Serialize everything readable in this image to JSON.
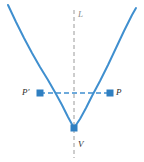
{
  "figure": {
    "background_color": "#ffffff",
    "width": 144,
    "height": 162
  },
  "colors": {
    "curve": "#3f8fcf",
    "chord": "#3f8fcf",
    "point_marker": "#2f7fc1",
    "axis_dashed": "#9a9a9a",
    "label_text": "#2b2b2b",
    "label_text_dim": "#8a8a8a"
  },
  "labels": {
    "axis_line": "L",
    "point_left": "P′",
    "point_right": "P",
    "vertex": "V"
  },
  "chart_data": {
    "type": "line",
    "xlabel": "",
    "ylabel": "",
    "grid": false,
    "legend": false,
    "xlim": [
      0,
      144
    ],
    "ylim": [
      162,
      0
    ],
    "series": [
      {
        "name": "parabola",
        "style": "solid",
        "color": "#3f8fcf",
        "points": [
          [
            8,
            5
          ],
          [
            16,
            22
          ],
          [
            24,
            38
          ],
          [
            32,
            53
          ],
          [
            40,
            67
          ],
          [
            48,
            80
          ],
          [
            56,
            94
          ],
          [
            62,
            105
          ],
          [
            68,
            117
          ],
          [
            74,
            128
          ],
          [
            80,
            119
          ],
          [
            86,
            108
          ],
          [
            92,
            96
          ],
          [
            100,
            81
          ],
          [
            108,
            65
          ],
          [
            116,
            48
          ],
          [
            124,
            31
          ],
          [
            132,
            15
          ],
          [
            136,
            8
          ]
        ]
      },
      {
        "name": "axis-of-symmetry",
        "style": "dashed",
        "color": "#9a9a9a",
        "points": [
          [
            74,
            10
          ],
          [
            74,
            158
          ]
        ]
      },
      {
        "name": "focal-chord",
        "style": "dashed",
        "color": "#3f8fcf",
        "points": [
          [
            40,
            93
          ],
          [
            110,
            93
          ]
        ]
      }
    ],
    "annotations": [
      {
        "name": "P-prime",
        "label": "P′",
        "x": 40,
        "y": 93,
        "marker": "square"
      },
      {
        "name": "P",
        "label": "P",
        "x": 110,
        "y": 93,
        "marker": "square"
      },
      {
        "name": "V",
        "label": "V",
        "x": 74,
        "y": 128,
        "marker": "square"
      },
      {
        "name": "L",
        "label": "L",
        "x": 74,
        "y": 14,
        "marker": "none"
      }
    ]
  }
}
